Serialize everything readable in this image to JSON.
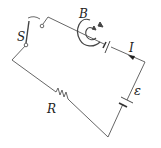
{
  "diagram": {
    "type": "circuit",
    "labels": {
      "switch": "S",
      "magnetic_field": "B",
      "current": "I",
      "emf": "ε",
      "resistor": "R"
    },
    "components": [
      {
        "name": "switch",
        "label": "S",
        "state": "open"
      },
      {
        "name": "magnetic-field-loops",
        "label": "B"
      },
      {
        "name": "battery-top",
        "label": ""
      },
      {
        "name": "current-arrow",
        "label": "I"
      },
      {
        "name": "battery-emf",
        "label": "ε"
      },
      {
        "name": "resistor",
        "label": "R"
      }
    ],
    "colors": {
      "line": "#555555",
      "text": "#222222",
      "background": "#ffffff"
    }
  }
}
